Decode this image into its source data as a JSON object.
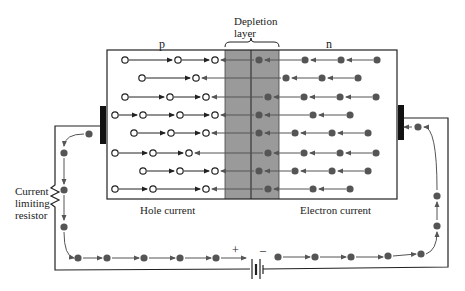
{
  "diagram": {
    "colors": {
      "ink": "#222222",
      "depletion": "#9a9a9a",
      "electron": "#555555",
      "terminal": "#111111"
    },
    "labels": {
      "p_region": "p",
      "n_region": "n",
      "depletion_line1": "Depletion",
      "depletion_line2": "layer",
      "hole_current": "Hole current",
      "electron_current": "Electron current",
      "resistor_line1": "Current",
      "resistor_line2": "limiting",
      "resistor_line3": "resistor",
      "battery_plus": "+",
      "battery_minus": "–"
    },
    "box": {
      "x": 107,
      "y": 50,
      "w": 290,
      "h": 149
    },
    "depletion": {
      "x1": 225,
      "mid": 251,
      "x2": 279
    },
    "rows_y": [
      60,
      78,
      97,
      115,
      133,
      153,
      171,
      189
    ],
    "holes": [
      [
        125,
        178,
        215
      ],
      [
        142,
        196
      ],
      [
        125,
        170,
        206
      ],
      [
        115,
        143,
        180,
        215
      ],
      [
        134,
        171,
        206
      ],
      [
        115,
        153,
        189
      ],
      [
        143,
        180,
        215
      ],
      [
        115,
        153,
        206
      ]
    ],
    "electrons": [
      [
        259,
        305,
        341,
        377
      ],
      [
        286,
        322,
        358
      ],
      [
        268,
        304,
        340,
        376
      ],
      [
        259,
        313,
        350
      ],
      [
        259,
        295,
        332,
        368
      ],
      [
        268,
        304,
        340,
        376
      ],
      [
        259,
        295,
        332,
        368
      ],
      [
        268,
        313,
        350
      ]
    ],
    "circuit": {
      "left_wire_x": 55,
      "right_wire_x": 448,
      "bottom_wire_y": 270,
      "left_terminal_y": 126,
      "right_terminal_y": 128,
      "battery_x": 255
    }
  }
}
